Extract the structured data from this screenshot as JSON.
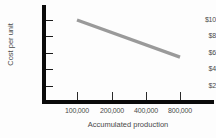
{
  "chart_data": {
    "type": "line",
    "title": "",
    "xlabel": "Accumulated production",
    "ylabel": "Cost per unit",
    "x_scale": "log",
    "x_tick_labels": [
      "100,000",
      "200,000",
      "400,000",
      "800,000"
    ],
    "x_tick_values": [
      100000,
      200000,
      400000,
      800000
    ],
    "y_tick_labels": [
      "$10",
      "$8",
      "$6",
      "$4",
      "$2"
    ],
    "y_tick_values": [
      10,
      8,
      6,
      4,
      2
    ],
    "ylim": [
      0,
      11
    ],
    "grid": false,
    "legend": false,
    "series": [
      {
        "name": "Experience curve",
        "color": "#9a9a9a",
        "x": [
          100000,
          200000,
          400000,
          800000
        ],
        "values": [
          10.0,
          8.5,
          7.0,
          5.5
        ]
      }
    ],
    "annotations": []
  },
  "axes": {
    "y_title": "Cost per unit",
    "x_title": "Accumulated production",
    "y_labels": [
      "$10",
      "$8",
      "$6",
      "$4",
      "$2"
    ],
    "x_labels": [
      "100,000",
      "200,000",
      "400,000",
      "800,000"
    ]
  },
  "colors": {
    "axis": "#0a0a0a",
    "tick": "#2a2a2a",
    "text": "#4a4a4a",
    "series": "#9a9a9a",
    "background": "#fdfdfd"
  }
}
